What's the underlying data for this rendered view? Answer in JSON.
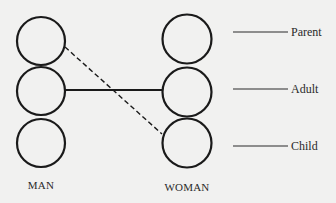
{
  "diagram": {
    "columns": [
      {
        "id": "man",
        "label": "MAN",
        "cx": 41,
        "states": [
          {
            "state": "Parent",
            "cy": 41
          },
          {
            "state": "Adult",
            "cy": 91
          },
          {
            "state": "Child",
            "cy": 143
          }
        ]
      },
      {
        "id": "woman",
        "label": "WOMAN",
        "cx": 187,
        "states": [
          {
            "state": "Parent",
            "cy": 39
          },
          {
            "state": "Adult",
            "cy": 92
          },
          {
            "state": "Child",
            "cy": 143
          }
        ]
      }
    ],
    "ego_states": [
      {
        "label": "Parent",
        "y": 32
      },
      {
        "label": "Adult",
        "y": 89
      },
      {
        "label": "Child",
        "y": 146
      }
    ],
    "transactions": [
      {
        "from": "MAN Adult",
        "to": "WOMAN Adult",
        "style": "solid"
      },
      {
        "from": "MAN Parent",
        "to": "WOMAN Child",
        "style": "dashed"
      }
    ],
    "colors": {
      "stroke": "#1a1a1a",
      "background": "#f1f1f0",
      "text": "#2a2a2a"
    }
  }
}
